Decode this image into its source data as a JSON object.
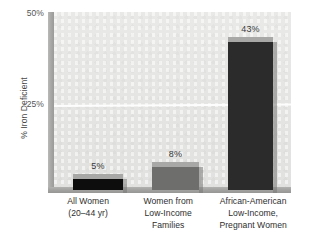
{
  "chart_data": {
    "type": "bar",
    "title": "",
    "subtitle": "",
    "xlabel": "",
    "ylabel": "% Iron Deficient",
    "ylim": [
      0,
      50
    ],
    "yticks": [
      "25%",
      "50%"
    ],
    "ytick_values": [
      25,
      50
    ],
    "grid": true,
    "gridlines_at": [
      25
    ],
    "legend": "none",
    "categories": [
      "All Women (20–44 yr)",
      "Women from Low-Income Families",
      "African-American Low-Income, Pregnant Women"
    ],
    "values": [
      5,
      8,
      43
    ],
    "data_labels": [
      "5%",
      "8%",
      "43%"
    ],
    "bar_colors": [
      "#0d0d0d",
      "#6e6e6c",
      "#2b2b2b"
    ],
    "bar_cap_color": "#a8a8a6",
    "plot_background": "#e6e6e4",
    "axis_color": "#a2a2a0",
    "gridline_color": "#fdfdfd",
    "text_color": "#2e2e2e"
  },
  "axes": {
    "y_title": "% Iron Deficient",
    "y_ticks": {
      "top": "50%",
      "middle": "25%"
    }
  },
  "bars": [
    {
      "value_label": "5%",
      "category_lines": [
        "All Women",
        "(20–44 yr)"
      ]
    },
    {
      "value_label": "8%",
      "category_lines": [
        "Women from",
        "Low-Income",
        "Families"
      ]
    },
    {
      "value_label": "43%",
      "category_lines": [
        "African-American",
        "Low-Income,",
        "Pregnant Women"
      ]
    }
  ]
}
